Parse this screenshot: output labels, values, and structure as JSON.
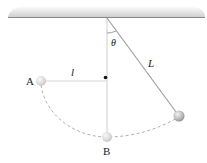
{
  "diagram": {
    "title": "",
    "labels": {
      "point_a": "A",
      "point_b": "B",
      "length_short": "l",
      "length_long": "L",
      "angle": "θ"
    },
    "colors": {
      "ceiling_line": "#8a8a8a",
      "ceiling_shade": "#d8d8d8",
      "string": "#a0a0a0",
      "guide_line": "#d6d6d6",
      "dashed_path": "#b0b0b0",
      "ball": "#b8b8b8",
      "peg": "#111111"
    }
  }
}
